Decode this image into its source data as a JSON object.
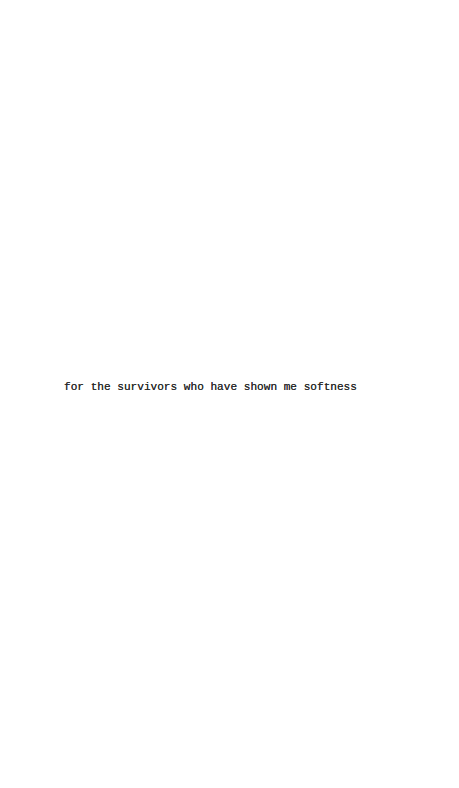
{
  "page": {
    "background_color": "#ffffff",
    "dedication": {
      "text": "for the survivors who have shown me softness",
      "color": "#2a2a2a"
    }
  }
}
